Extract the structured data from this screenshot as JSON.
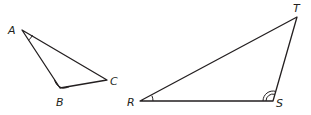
{
  "figure": {
    "stroke_color": "#231f20",
    "background": "#ffffff",
    "triangles": [
      {
        "name": "ABC",
        "vertices": [
          {
            "label": "A",
            "x": 22,
            "y": 30,
            "lx": 8,
            "ly": 34
          },
          {
            "label": "B",
            "x": 60,
            "y": 88,
            "lx": 56,
            "ly": 106
          },
          {
            "label": "C",
            "x": 107,
            "y": 80,
            "lx": 110,
            "ly": 85
          }
        ],
        "angle_marks": [
          {
            "vertex": "A",
            "arcs": 1
          },
          {
            "vertex": "B",
            "arcs": 2
          }
        ]
      },
      {
        "name": "RST",
        "vertices": [
          {
            "label": "R",
            "x": 140,
            "y": 101,
            "lx": 127,
            "ly": 106
          },
          {
            "label": "S",
            "x": 273,
            "y": 101,
            "lx": 276,
            "ly": 107
          },
          {
            "label": "T",
            "x": 297,
            "y": 17,
            "lx": 293,
            "ly": 12
          }
        ],
        "angle_marks": [
          {
            "vertex": "R",
            "arcs": 1
          },
          {
            "vertex": "S",
            "arcs": 2
          }
        ]
      }
    ]
  }
}
